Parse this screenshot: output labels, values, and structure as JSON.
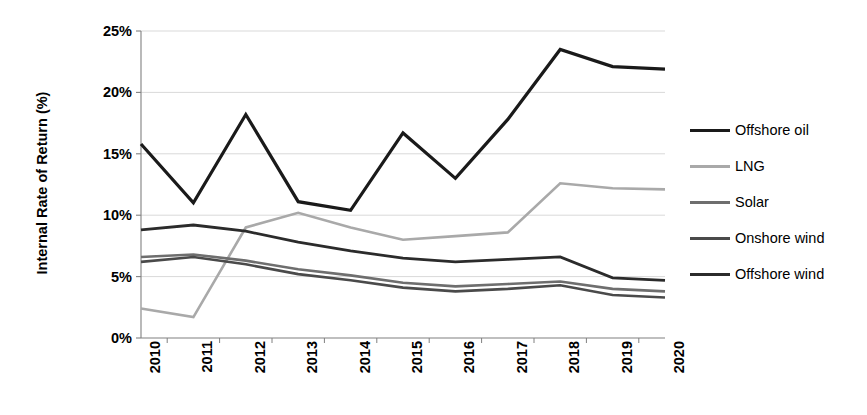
{
  "chart_data": {
    "type": "line",
    "title": "",
    "subtitle": "",
    "xlabel": "",
    "ylabel": "Internal Rate of Return (%)",
    "categories": [
      "2010",
      "2011",
      "2012",
      "2013",
      "2014",
      "2015",
      "2016",
      "2017",
      "2018",
      "2019",
      "2020"
    ],
    "x": [
      2010,
      2011,
      2012,
      2013,
      2014,
      2015,
      2016,
      2017,
      2018,
      2019,
      2020
    ],
    "ylim": [
      0,
      25
    ],
    "y_ticks": [
      0,
      5,
      10,
      15,
      20,
      25
    ],
    "y_tick_labels": [
      "0%",
      "5%",
      "10%",
      "15%",
      "20%",
      "25%"
    ],
    "grid": "horizontal",
    "legend_position": "right",
    "series": [
      {
        "name": "Offshore oil",
        "color": "#1a1a1a",
        "width": 3.2,
        "values": [
          15.8,
          11.0,
          18.2,
          11.1,
          10.4,
          16.7,
          13.0,
          17.8,
          23.5,
          22.1,
          21.9
        ]
      },
      {
        "name": "LNG",
        "color": "#a9a9a9",
        "width": 2.6,
        "values": [
          2.4,
          1.7,
          9.0,
          10.2,
          9.0,
          8.0,
          8.3,
          8.6,
          12.6,
          12.2,
          12.1
        ]
      },
      {
        "name": "Solar",
        "color": "#6e6e6e",
        "width": 2.6,
        "values": [
          6.6,
          6.8,
          6.3,
          5.6,
          5.1,
          4.5,
          4.2,
          4.4,
          4.6,
          4.0,
          3.8
        ]
      },
      {
        "name": "Onshore wind",
        "color": "#4a4a4a",
        "width": 2.6,
        "values": [
          6.2,
          6.6,
          6.0,
          5.2,
          4.7,
          4.1,
          3.8,
          4.0,
          4.3,
          3.5,
          3.3
        ]
      },
      {
        "name": "Offshore wind",
        "color": "#2b2b2b",
        "width": 2.8,
        "values": [
          8.8,
          9.2,
          8.7,
          7.8,
          7.1,
          6.5,
          6.2,
          6.4,
          6.6,
          4.9,
          4.7
        ]
      }
    ]
  },
  "axes": {
    "y_title": "Internal Rate of Return (%)",
    "axis_color": "#808080",
    "gridline_color": "#d9d9d9"
  },
  "legend": {
    "entries": [
      {
        "label": "Offshore oil"
      },
      {
        "label": "LNG"
      },
      {
        "label": "Solar"
      },
      {
        "label": "Onshore wind"
      },
      {
        "label": "Offshore wind"
      }
    ]
  }
}
